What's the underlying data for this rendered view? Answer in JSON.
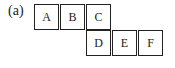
{
  "figure": {
    "label": "(a)",
    "cells": [
      {
        "text": "A",
        "row": 0,
        "col": 0
      },
      {
        "text": "B",
        "row": 0,
        "col": 1
      },
      {
        "text": "C",
        "row": 0,
        "col": 2
      },
      {
        "text": "D",
        "row": 1,
        "col": 2
      },
      {
        "text": "E",
        "row": 1,
        "col": 3
      },
      {
        "text": "F",
        "row": 1,
        "col": 4
      }
    ]
  }
}
